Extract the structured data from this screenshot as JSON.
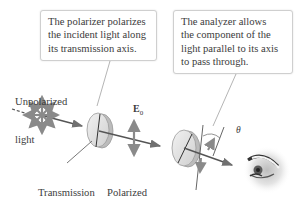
{
  "callouts": {
    "polarizer": {
      "lines": [
        "The polarizer polarizes",
        "the incident light along",
        "its transmission axis."
      ]
    },
    "analyzer": {
      "lines": [
        "The analyzer allows",
        "the component of the",
        "light parallel to its axis",
        "to pass through."
      ]
    }
  },
  "labels": {
    "unpolarized": [
      "Unpolarized",
      "light"
    ],
    "transmission_axis": [
      "Transmission",
      "axis"
    ],
    "polarized": [
      "Polarized",
      "light"
    ],
    "e_field": "E",
    "e_field_sub": "0",
    "angle": "θ"
  },
  "colors": {
    "beam": "#555555",
    "arrows": "#8a8a8a",
    "disc_fill": "#e6e6e6",
    "disc_edge": "#9a9a9a",
    "callout_border": "#cfcfcf",
    "text": "#3b3b3b"
  }
}
